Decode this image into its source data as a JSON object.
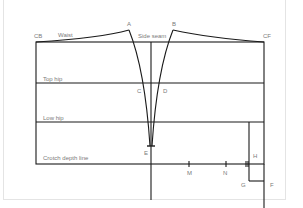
{
  "diagram": {
    "labels": {
      "cb": "CB",
      "cf": "CF",
      "waist": "Waist",
      "side_seam": "Side seam",
      "top_hip": "Top hip",
      "low_hip": "Low hip",
      "crotch_depth": "Crotch depth line",
      "A": "A",
      "B": "B",
      "C": "C",
      "D": "D",
      "E": "E",
      "F": "F",
      "G": "G",
      "H": "H",
      "M": "M",
      "N": "N"
    },
    "colors": {
      "line": "#1a1a1a",
      "label": "#7a7a7a",
      "border": "#e4e4e4"
    }
  }
}
